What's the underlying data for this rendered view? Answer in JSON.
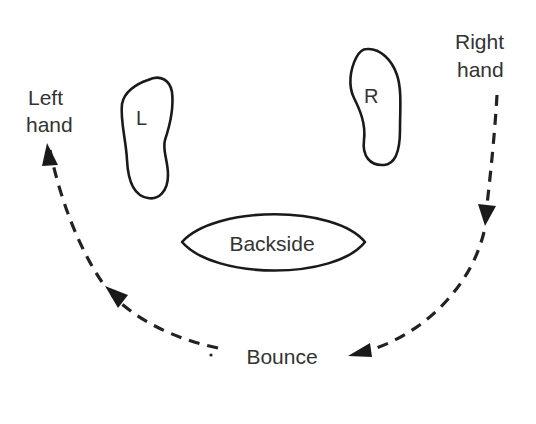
{
  "diagram": {
    "labels": {
      "left_hand_line1": "Left",
      "left_hand_line2": "hand",
      "right_hand_line1": "Right",
      "right_hand_line2": "hand",
      "left_foot": "L",
      "right_foot": "R",
      "backside": "Backside",
      "bounce": "Bounce"
    },
    "colors": {
      "stroke": "#1a1a1a",
      "text": "#333333",
      "background": "#ffffff"
    },
    "flow": [
      {
        "from": "Right hand",
        "to": "Bounce",
        "style": "dashed-arrow"
      },
      {
        "from": "Bounce",
        "to": "Left hand",
        "style": "dashed-arrow"
      }
    ]
  }
}
